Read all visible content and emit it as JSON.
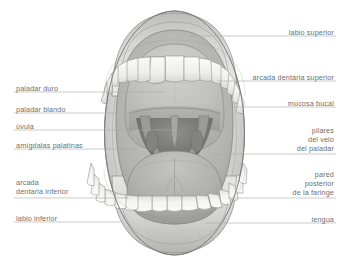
{
  "figure": {
    "language": "es",
    "background_color": "#ffffff",
    "label_color": "#6e6e6e",
    "leader_color": "#a8a8a8"
  },
  "labels": {
    "left": [
      {
        "id": "paladar-duro",
        "text": "paladar duro",
        "lines": [
          "paladar duro"
        ],
        "x": 16,
        "y": 84,
        "leader_y": 92,
        "leader_x2": 165
      },
      {
        "id": "paladar-blando",
        "text": "paladar blando",
        "lines": [
          "paladar blando"
        ],
        "x": 16,
        "y": 105,
        "leader_y": 113,
        "leader_x2": 160
      },
      {
        "id": "uvula",
        "text": "úvula",
        "lines": [
          "úvula"
        ],
        "x": 16,
        "y": 122,
        "leader_y": 130,
        "leader_x2": 175
      },
      {
        "id": "amigdalas-palatinas",
        "text": "amígdalas palatinas",
        "lines": [
          "amígdalas palatinas"
        ],
        "x": 16,
        "y": 141,
        "leader_y": 149,
        "leader_x2": 137
      },
      {
        "id": "arcada-dentaria-inferior",
        "text": "arcada dentaria inferior",
        "lines": [
          "arcada",
          "dentaria inferior"
        ],
        "x": 16,
        "y": 178,
        "leader_y": 198,
        "leader_x2": 128
      },
      {
        "id": "labio-inferior",
        "text": "labio inferior",
        "lines": [
          "labio inferior"
        ],
        "x": 16,
        "y": 214,
        "leader_y": 222,
        "leader_x2": 122
      }
    ],
    "right": [
      {
        "id": "labio-superior",
        "text": "labio superior",
        "lines": [
          "labio superior"
        ],
        "x": 334,
        "y": 28,
        "leader_y": 36,
        "leader_x2": 190
      },
      {
        "id": "arcada-dentaria-superior",
        "text": "arcada dentaria superior",
        "lines": [
          "arcada dentaria superior"
        ],
        "x": 334,
        "y": 73,
        "leader_y": 81,
        "leader_x2": 218
      },
      {
        "id": "mucosa-bucal",
        "text": "mucosa bucal",
        "lines": [
          "mucosa bucal"
        ],
        "x": 334,
        "y": 99,
        "leader_y": 107,
        "leader_x2": 234
      },
      {
        "id": "pilares-del-velo-del-paladar",
        "text": "pilares del velo del paladar",
        "lines": [
          "pilares",
          "del velo",
          "del paladar"
        ],
        "x": 334,
        "y": 126,
        "leader_y": 154,
        "leader_x2": 213
      },
      {
        "id": "pared-posterior-de-la-faringe",
        "text": "pared posterior de la faringe",
        "lines": [
          "pared",
          "posterior",
          "de la faringe"
        ],
        "x": 334,
        "y": 170,
        "leader_y": 198,
        "leader_x2": 228
      },
      {
        "id": "lengua",
        "text": "lengua",
        "lines": [
          "lengua"
        ],
        "x": 334,
        "y": 215,
        "leader_y": 223,
        "leader_x2": 205
      }
    ]
  },
  "anatomy": {
    "parts": [
      {
        "id": "upper-lip",
        "name": "labio superior",
        "color": "#cfcfcf"
      },
      {
        "id": "lower-lip",
        "name": "labio inferior",
        "color": "#d4d4d4"
      },
      {
        "id": "oral-mucosa",
        "name": "mucosa bucal",
        "color": "#b8b8b8"
      },
      {
        "id": "hard-palate",
        "name": "paladar duro",
        "color": "#c2c2c2"
      },
      {
        "id": "soft-palate",
        "name": "paladar blando",
        "color": "#9d9d9d"
      },
      {
        "id": "uvula",
        "name": "úvula",
        "color": "#8f8f8f"
      },
      {
        "id": "tonsils",
        "name": "amígdalas palatinas",
        "color": "#8a8a8a"
      },
      {
        "id": "pharynx-wall",
        "name": "pared posterior de la faringe",
        "color": "#6f6f6f"
      },
      {
        "id": "tongue",
        "name": "lengua",
        "color": "#adadad"
      },
      {
        "id": "upper-teeth",
        "name": "arcada dentaria superior",
        "color": "#f2f2f0"
      },
      {
        "id": "lower-teeth",
        "name": "arcada dentaria inferior",
        "color": "#f2f2f0"
      }
    ],
    "upper_teeth_count": 16,
    "lower_teeth_count": 16
  }
}
